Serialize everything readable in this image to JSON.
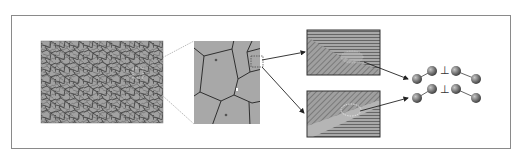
{
  "diagram": {
    "type": "multiscale-microstructure-schematic",
    "panels": [
      {
        "id": "micrograph",
        "description": "polycrystalline grain micrograph"
      },
      {
        "id": "grain-zoom",
        "description": "magnified grains with boundaries"
      },
      {
        "id": "boundary-top",
        "description": "grain boundary with horizontal and diagonal lattice planes"
      },
      {
        "id": "boundary-bottom",
        "description": "grain boundary with band and lattice planes"
      },
      {
        "id": "dislocations",
        "description": "atomic chains with dislocation symbols"
      }
    ],
    "symbols": {
      "dislocation_top": "⊥",
      "dislocation_bottom": "⊥"
    },
    "colors": {
      "frame": "#8a8a8a",
      "grain_fill": "#a9a9a9",
      "grain_boundary": "#333333",
      "hatch_bg": "#9a9a9a",
      "atom": "#6e6e6e",
      "arrow": "#222222"
    }
  }
}
